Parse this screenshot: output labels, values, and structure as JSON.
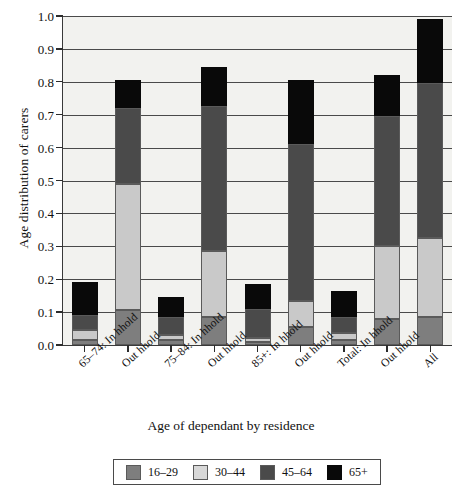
{
  "chart_data": {
    "type": "bar",
    "subtype": "stacked-bar",
    "title": "",
    "xlabel": "Age of dependant by residence",
    "ylabel": "Age distribution of carers",
    "ylim": [
      0.0,
      1.0
    ],
    "ytick_labels": [
      "0.0",
      "0.1",
      "0.2",
      "0.3",
      "0.4",
      "0.5",
      "0.6",
      "0.7",
      "0.8",
      "0.9",
      "1.0"
    ],
    "ytick_values": [
      0.0,
      0.1,
      0.2,
      0.3,
      0.4,
      0.5,
      0.6,
      0.7,
      0.8,
      0.9,
      1.0
    ],
    "grid": true,
    "legend_position": "bottom",
    "categories": [
      "65–74: In hhold",
      "Out hhold",
      "75–84: In hhold",
      "Out hhold",
      "85+: In hhold",
      "Out hhold",
      "Total: In hhold",
      "Out hhold",
      "All"
    ],
    "series": [
      {
        "name": "16–29",
        "color": "#7e7e7e",
        "values": [
          0.015,
          0.105,
          0.015,
          0.085,
          0.01,
          0.055,
          0.015,
          0.08,
          0.085
        ]
      },
      {
        "name": "30–44",
        "color": "#c9c9c9",
        "values": [
          0.045,
          0.49,
          0.03,
          0.285,
          0.02,
          0.135,
          0.035,
          0.3,
          0.325
        ]
      },
      {
        "name": "45–64",
        "color": "#4a4a4a",
        "values": [
          0.09,
          0.72,
          0.085,
          0.725,
          0.11,
          0.61,
          0.085,
          0.695,
          0.795
        ]
      },
      {
        "name": "65+",
        "color": "#090909",
        "values": [
          0.19,
          0.805,
          0.145,
          0.845,
          0.185,
          0.805,
          0.165,
          0.82,
          0.99
        ]
      }
    ],
    "cumulative_tops_note": "series values are cumulative stack tops read off the axis",
    "stack_tops": [
      {
        "category": "65–74: In hhold",
        "16–29": 0.015,
        "30–44": 0.045,
        "45–64": 0.09,
        "65+": 0.19
      },
      {
        "category": "Out hhold",
        "16–29": 0.105,
        "30–44": 0.49,
        "45–64": 0.72,
        "65+": 0.805
      },
      {
        "category": "75–84: In hhold",
        "16–29": 0.015,
        "30–44": 0.03,
        "45–64": 0.085,
        "65+": 0.145
      },
      {
        "category": "Out hhold",
        "16–29": 0.085,
        "30–44": 0.285,
        "45–64": 0.725,
        "65+": 0.845
      },
      {
        "category": "85+: In hhold",
        "16–29": 0.01,
        "30–44": 0.02,
        "45–64": 0.11,
        "65+": 0.185
      },
      {
        "category": "Out hhold",
        "16–29": 0.055,
        "30–44": 0.135,
        "45–64": 0.61,
        "65+": 0.805
      },
      {
        "category": "Total: In hhold",
        "16–29": 0.015,
        "30–44": 0.035,
        "45–64": 0.085,
        "65+": 0.165
      },
      {
        "category": "Out hhold",
        "16–29": 0.08,
        "30–44": 0.3,
        "45–64": 0.695,
        "65+": 0.82
      },
      {
        "category": "All",
        "16–29": 0.085,
        "30–44": 0.325,
        "45–64": 0.795,
        "65+": 0.99
      }
    ],
    "legend": [
      {
        "label": "16–29",
        "color": "#7e7e7e"
      },
      {
        "label": "30–44",
        "color": "#d8d8d8"
      },
      {
        "label": "45–64",
        "color": "#4a4a4a"
      },
      {
        "label": "65+",
        "color": "#090909"
      }
    ]
  }
}
